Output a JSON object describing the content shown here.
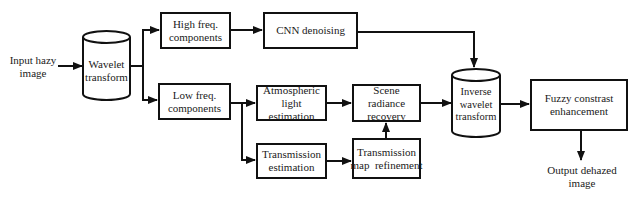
{
  "diagram": {
    "type": "flowchart",
    "nodes": {
      "input": {
        "line1": "Input hazy",
        "line2": "image"
      },
      "wavelet": {
        "line1": "Wavelet",
        "line2": "transform"
      },
      "high_freq": {
        "line1": "High freq.",
        "line2": "components"
      },
      "cnn": {
        "line1": "CNN denoising"
      },
      "low_freq": {
        "line1": "Low freq.",
        "line2": "components"
      },
      "atmospheric": {
        "line1": "Atmospheric",
        "line2": "light estimation"
      },
      "scene": {
        "line1": "Scene radiance",
        "line2": "recovery"
      },
      "trans_est": {
        "line1": "Transmission",
        "line2": "estimation"
      },
      "trans_ref": {
        "line1": "Transmission",
        "line2": "map  refinement"
      },
      "inverse": {
        "line1": "Inverse",
        "line2": "wavelet",
        "line3": "transform"
      },
      "fuzzy": {
        "line1": "Fuzzy constrast",
        "line2": "enhancement"
      },
      "output": {
        "line1": "Output dehazed",
        "line2": "image"
      }
    },
    "edges": [
      [
        "Input hazy image",
        "Wavelet transform"
      ],
      [
        "Wavelet transform",
        "High freq. components"
      ],
      [
        "Wavelet transform",
        "Low freq. components"
      ],
      [
        "High freq. components",
        "CNN denoising"
      ],
      [
        "CNN denoising",
        "Inverse wavelet transform"
      ],
      [
        "Low freq. components",
        "Atmospheric light estimation"
      ],
      [
        "Low freq. components",
        "Transmission estimation"
      ],
      [
        "Atmospheric light estimation",
        "Scene radiance recovery"
      ],
      [
        "Transmission estimation",
        "Transmission map refinement"
      ],
      [
        "Transmission map refinement",
        "Scene radiance recovery"
      ],
      [
        "Scene radiance recovery",
        "Inverse wavelet transform"
      ],
      [
        "Inverse wavelet transform",
        "Fuzzy constrast enhancement"
      ],
      [
        "Fuzzy constrast enhancement",
        "Output dehazed image"
      ]
    ],
    "colors": {
      "stroke": "#111111",
      "background": "#ffffff"
    }
  }
}
